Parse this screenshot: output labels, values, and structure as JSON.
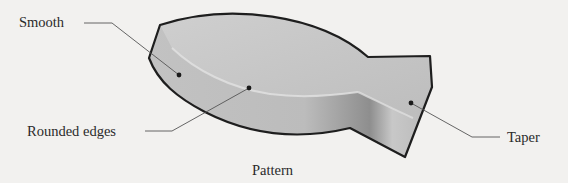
{
  "diagram": {
    "caption": "Pattern",
    "labels": {
      "smooth": "Smooth",
      "rounded_edges": "Rounded edges",
      "taper": "Taper"
    },
    "colors": {
      "background": "#f2f1ef",
      "outline": "#1e1e1e",
      "fill_light": "#d2d2d2",
      "fill_dark": "#9a9a9a",
      "leader": "#555555"
    }
  }
}
